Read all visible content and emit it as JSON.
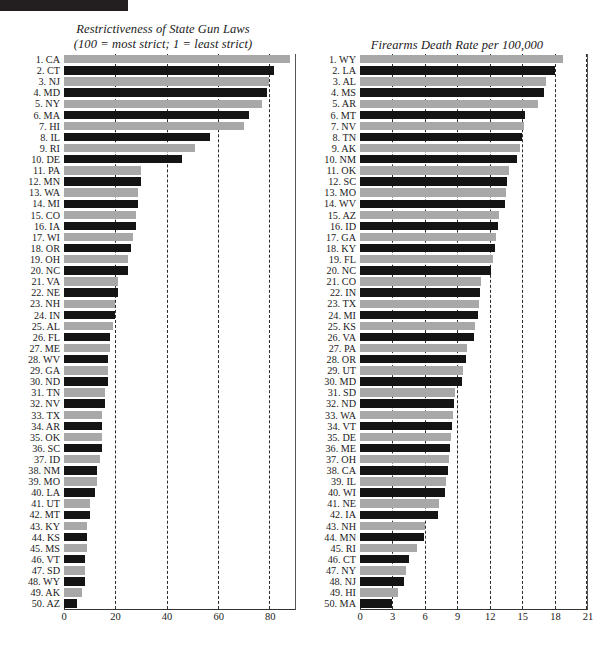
{
  "header": {
    "bar_color": "#231f20"
  },
  "palette": {
    "bar_dark": "#141414",
    "bar_light": "#a8a8a8",
    "gridline": "#2b2b2b",
    "axis": "#333333",
    "background": "#ffffff"
  },
  "chart_data": [
    {
      "id": "gun-laws",
      "type": "bar",
      "orientation": "horizontal",
      "title": "Restrictiveness of State Gun Laws\n(100 = most strict; 1 = least strict)",
      "title_line1": "Restrictiveness of State Gun Laws",
      "title_line2": "(100 = most strict; 1 = least strict)",
      "xlabel": "",
      "ylabel": "",
      "xlim": [
        0,
        90
      ],
      "ticks": [
        0,
        20,
        40,
        60,
        80
      ],
      "tick_labels": [
        "0",
        "20",
        "40",
        "60",
        "80"
      ],
      "grid": true,
      "legend": "none",
      "categories": [
        "CA",
        "CT",
        "NJ",
        "MD",
        "NY",
        "MA",
        "HI",
        "IL",
        "RI",
        "DE",
        "PA",
        "MN",
        "WA",
        "MI",
        "CO",
        "IA",
        "WI",
        "OR",
        "OH",
        "NC",
        "VA",
        "NE",
        "NH",
        "IN",
        "AL",
        "FL",
        "ME",
        "WV",
        "GA",
        "ND",
        "TN",
        "NV",
        "TX",
        "AR",
        "OK",
        "SC",
        "ID",
        "NM",
        "MO",
        "LA",
        "UT",
        "MT",
        "KY",
        "KS",
        "MS",
        "VT",
        "SD",
        "WY",
        "AK",
        "AZ"
      ],
      "rank_labels": [
        "1. CA",
        "2. CT",
        "3. NJ",
        "4. MD",
        "5. NY",
        "6. MA",
        "7. HI",
        "8. IL",
        "9. RI",
        "10. DE",
        "11. PA",
        "12. MN",
        "13. WA",
        "14. MI",
        "15. CO",
        "16. IA",
        "17. WI",
        "18. OR",
        "19. OH",
        "20. NC",
        "21. VA",
        "22. NE",
        "23. NH",
        "24. IN",
        "25. AL",
        "26. FL",
        "27. ME",
        "28. WV",
        "29. GA",
        "30. ND",
        "31. TN",
        "32. NV",
        "33. TX",
        "34. AR",
        "35. OK",
        "36. SC",
        "37. ID",
        "38. NM",
        "39. MO",
        "40. LA",
        "41. UT",
        "42. MT",
        "43. KY",
        "44. KS",
        "45. MS",
        "46. VT",
        "47. SD",
        "48. WY",
        "49. AK",
        "50. AZ"
      ],
      "values": [
        88,
        82,
        80,
        79,
        77,
        72,
        70,
        57,
        51,
        46,
        30,
        30,
        29,
        29,
        28,
        28,
        27,
        26,
        25,
        25,
        21,
        21,
        20,
        20,
        19,
        18,
        18,
        17,
        17,
        17,
        16,
        16,
        15,
        15,
        15,
        15,
        14,
        13,
        13,
        12,
        10,
        10,
        9,
        9,
        9,
        8,
        8,
        8,
        7,
        5
      ]
    },
    {
      "id": "firearms-death-rate",
      "type": "bar",
      "orientation": "horizontal",
      "title": "Firearms Death Rate per 100,000",
      "title_line1": "Firearms Death Rate per 100,000",
      "title_line2": "",
      "xlabel": "",
      "ylabel": "",
      "xlim": [
        0,
        21
      ],
      "ticks": [
        0,
        3,
        6,
        9,
        12,
        15,
        18,
        21
      ],
      "tick_labels": [
        "0",
        "3",
        "6",
        "9",
        "12",
        "15",
        "18",
        "21"
      ],
      "grid": true,
      "legend": "none",
      "categories": [
        "WY",
        "LA",
        "AL",
        "MS",
        "AR",
        "MT",
        "NV",
        "TN",
        "AK",
        "NM",
        "OK",
        "SC",
        "MO",
        "WV",
        "AZ",
        "ID",
        "GA",
        "KY",
        "FL",
        "NC",
        "CO",
        "IN",
        "TX",
        "MI",
        "KS",
        "VA",
        "PA",
        "OR",
        "UT",
        "MD",
        "SD",
        "ND",
        "WA",
        "VT",
        "DE",
        "ME",
        "OH",
        "CA",
        "IL",
        "WI",
        "NE",
        "IA",
        "NH",
        "MN",
        "RI",
        "CT",
        "NY",
        "NJ",
        "HI",
        "MA"
      ],
      "rank_labels": [
        "1. WY",
        "2. LA",
        "3. AL",
        "4. MS",
        "5. AR",
        "6. MT",
        "7. NV",
        "8. TN",
        "9. AK",
        "10. NM",
        "11. OK",
        "12. SC",
        "13. MO",
        "14. WV",
        "15. AZ",
        "16. ID",
        "17. GA",
        "18. KY",
        "19. FL",
        "20. NC",
        "21. CO",
        "22. IN",
        "23. TX",
        "24. MI",
        "25. KS",
        "26. VA",
        "27. PA",
        "28. OR",
        "29. UT",
        "30. MD",
        "31. SD",
        "32. ND",
        "33. WA",
        "34. VT",
        "35. DE",
        "36. ME",
        "37. OH",
        "38. CA",
        "39. IL",
        "40. WI",
        "41. NE",
        "42. IA",
        "43. NH",
        "44. MN",
        "45. RI",
        "46. CT",
        "47. NY",
        "48. NJ",
        "49. HI",
        "50. MA"
      ],
      "values": [
        18.8,
        18.0,
        17.2,
        17.0,
        16.5,
        15.3,
        15.2,
        15.0,
        14.8,
        14.5,
        13.8,
        13.6,
        13.5,
        13.4,
        12.9,
        12.8,
        12.6,
        12.5,
        12.3,
        12.1,
        11.2,
        11.1,
        11.0,
        10.9,
        10.6,
        10.5,
        9.9,
        9.8,
        9.5,
        9.4,
        8.8,
        8.7,
        8.6,
        8.5,
        8.4,
        8.3,
        8.2,
        8.1,
        8.0,
        7.9,
        7.3,
        7.2,
        6.0,
        5.9,
        5.3,
        4.5,
        4.3,
        4.1,
        3.5,
        3.0
      ]
    }
  ]
}
